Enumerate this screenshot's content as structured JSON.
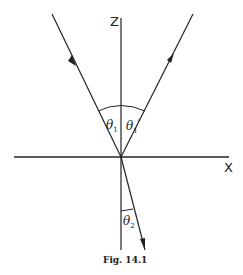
{
  "figure": {
    "caption": "Fig. 14.1",
    "axes": {
      "z_label": "Z",
      "x_label": "X"
    },
    "angles": [
      {
        "symbol": "θ",
        "subscript": "1",
        "prime": "",
        "role": "incidence angle"
      },
      {
        "symbol": "θ",
        "subscript": "1",
        "prime": "'",
        "role": "reflection angle"
      },
      {
        "symbol": "θ",
        "subscript": "2",
        "prime": "",
        "role": "refraction angle"
      }
    ],
    "rays": [
      "incident",
      "reflected",
      "refracted"
    ],
    "colors": {
      "ink": "#222222",
      "background": "#ffffff"
    }
  }
}
